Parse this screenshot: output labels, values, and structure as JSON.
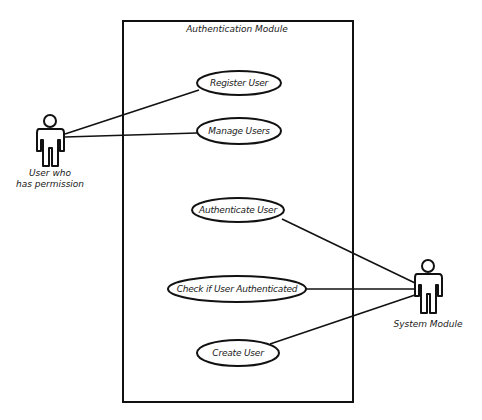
{
  "diagram": {
    "type": "uml-use-case",
    "system_boundary": {
      "title": "Authentication Module",
      "x": 123,
      "y": 21,
      "width": 230,
      "height": 381
    },
    "actors": [
      {
        "id": "user_with_permission",
        "label_line1": "User who",
        "label_line2": "has permission",
        "x": 50,
        "y": 121
      },
      {
        "id": "system_module",
        "label_line1": "System Module",
        "label_line2": "",
        "x": 428,
        "y": 266
      }
    ],
    "use_cases": [
      {
        "id": "register_user",
        "label": "Register User",
        "cx": 239,
        "cy": 83,
        "rx": 42,
        "ry": 12
      },
      {
        "id": "manage_users",
        "label": "Manage Users",
        "cx": 239,
        "cy": 131,
        "rx": 42,
        "ry": 13
      },
      {
        "id": "authenticate_user",
        "label": "Authenticate User",
        "cx": 238,
        "cy": 210,
        "rx": 46,
        "ry": 12
      },
      {
        "id": "check_if_user_authenticated",
        "label": "Check if User Authenticated",
        "cx": 237,
        "cy": 289,
        "rx": 69,
        "ry": 13
      },
      {
        "id": "create_user",
        "label": "Create User",
        "cx": 238,
        "cy": 353,
        "rx": 41,
        "ry": 13
      }
    ],
    "associations": [
      {
        "from": "user_with_permission",
        "to": "register_user"
      },
      {
        "from": "user_with_permission",
        "to": "manage_users"
      },
      {
        "from": "system_module",
        "to": "authenticate_user"
      },
      {
        "from": "system_module",
        "to": "check_if_user_authenticated"
      },
      {
        "from": "system_module",
        "to": "create_user"
      }
    ],
    "colors": {
      "stroke": "#111111",
      "background": "#ffffff",
      "text": "#1a1a1a"
    }
  }
}
